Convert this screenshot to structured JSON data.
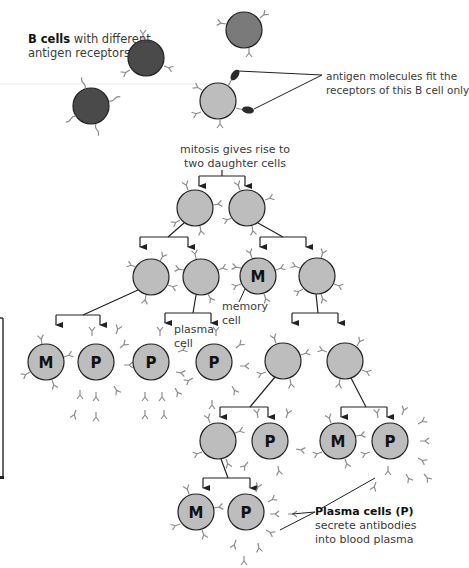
{
  "labels": {
    "b_cells_bold": "B cells",
    "b_cells_rest": " with different",
    "b_cells_line2": "antigen receptors",
    "antigen_line1": "antigen molecules fit the",
    "antigen_line2": "receptors of this B cell only",
    "mitosis_line1": "mitosis gives rise to",
    "mitosis_line2": "two daughter cells",
    "memory_line1": "memory",
    "memory_line2": "cell",
    "plasma_line1": "plasma",
    "plasma_line2": "cell",
    "plasma_cells_bold": "Plasma cells (P)",
    "plasma_cells_line2": "secrete antibodies",
    "plasma_cells_line3": "into blood plasma"
  },
  "cell_letters": {
    "memory": "M",
    "plasma": "P"
  },
  "colors": {
    "dark_cell": "#4a4a4a",
    "mid_cell": "#7a7a7a",
    "light_cell": "#bdbdbd",
    "outline": "#222222",
    "antibody": "#8c8c8c",
    "line": "#222222",
    "antigen": "#2a2a2a"
  }
}
